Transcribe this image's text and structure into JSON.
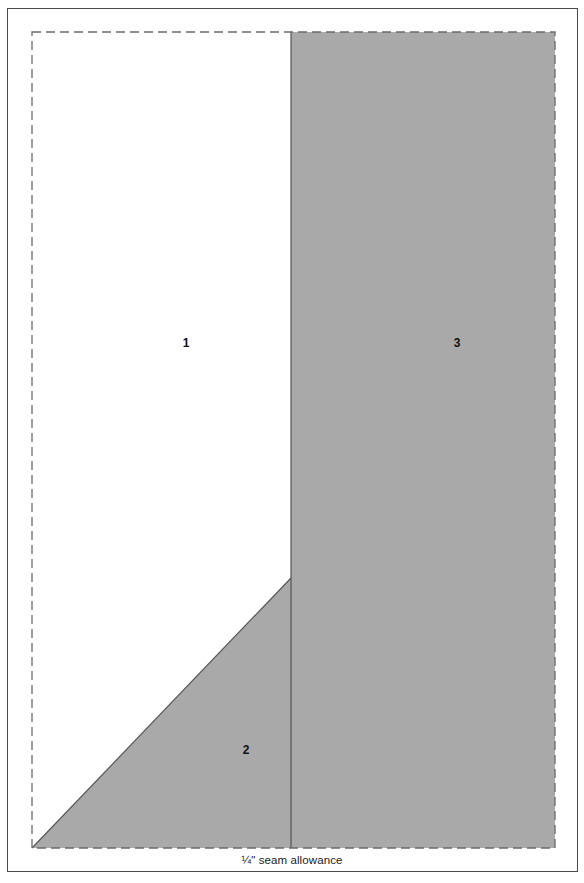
{
  "figure": {
    "kind": "quilt-piecing-template",
    "caption": "¼\" seam allowance",
    "colors": {
      "background": "#ffffff",
      "frame_stroke": "#4a4a4a",
      "cut_line_dashed": "#6b6b6b",
      "seam_line_solid": "#555555",
      "fabric_shaded": "#a9a9a9",
      "fabric_light": "#ffffff",
      "label_text": "#111111"
    },
    "outer_frame": {
      "x": 7,
      "y": 8,
      "width": 571,
      "height": 864
    },
    "cut_boundary": {
      "name": "dashed-cut-line",
      "x": 32,
      "y": 32,
      "width": 523,
      "height": 816,
      "dash": "9 5",
      "stroke_width": 1.3
    },
    "pieces": [
      {
        "id": 1,
        "label": "1",
        "name": "piece-1",
        "fill": "light",
        "label_x": 186,
        "label_y": 343,
        "polygon": "32,32 291,32 291,578 32,848"
      },
      {
        "id": 2,
        "label": "2",
        "name": "piece-2",
        "fill": "shaded",
        "label_x": 246,
        "label_y": 750,
        "polygon": "32,848 291,578 291,848"
      },
      {
        "id": 3,
        "label": "3",
        "name": "piece-3",
        "fill": "shaded",
        "label_x": 457,
        "label_y": 343,
        "polygon": "291,32 555,32 555,848 291,848"
      }
    ],
    "seam_lines": [
      {
        "name": "vertical-seam-line",
        "x1": 291,
        "y1": 32,
        "x2": 291,
        "y2": 848
      },
      {
        "name": "diagonal-seam-line",
        "x1": 32,
        "y1": 848,
        "x2": 291,
        "y2": 578
      }
    ],
    "caption_position": {
      "x": 292,
      "y": 861
    }
  }
}
